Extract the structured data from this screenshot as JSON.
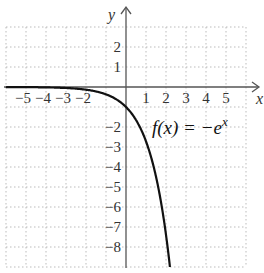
{
  "chart_data": {
    "type": "line",
    "title": "",
    "xlabel": "x",
    "ylabel": "y",
    "xlim": [
      -6,
      6
    ],
    "ylim": [
      -9,
      3
    ],
    "grid": true,
    "grid_style": "dotted",
    "x_ticks": [
      -5,
      -4,
      -3,
      -2,
      1,
      2,
      3,
      4,
      5
    ],
    "x_tick_labels": [
      "−5",
      "−4",
      "−3",
      "−2",
      "1",
      "2",
      "3",
      "4",
      "5"
    ],
    "y_ticks": [
      2,
      1,
      -2,
      -3,
      -4,
      -5,
      -6,
      -7,
      -8
    ],
    "y_tick_labels": [
      "2",
      "1",
      "−2",
      "−3",
      "−4",
      "−5",
      "−6",
      "−7",
      "−8"
    ],
    "series": [
      {
        "name": "f(x) = −e^x",
        "function": "-exp(x)",
        "x": [
          -6,
          -5,
          -4,
          -3,
          -2,
          -1,
          0,
          0.5,
          1,
          1.5,
          2,
          2.2
        ],
        "y": [
          -0.0025,
          -0.0067,
          -0.018,
          -0.05,
          -0.135,
          -0.368,
          -1,
          -1.649,
          -2.718,
          -4.482,
          -7.389,
          -9.025
        ]
      }
    ],
    "annotations": [
      {
        "text_main": "f(x) = −e",
        "text_sup": "x",
        "x": 1.4,
        "y": -1.7
      }
    ],
    "legend": "none"
  },
  "labels": {
    "x_axis": "x",
    "y_axis": "y",
    "function_main": "f(x) = −e",
    "function_sup": "x"
  },
  "colors": {
    "curve": "#111111",
    "axis": "#555555",
    "grid": "#bbbbbb"
  }
}
